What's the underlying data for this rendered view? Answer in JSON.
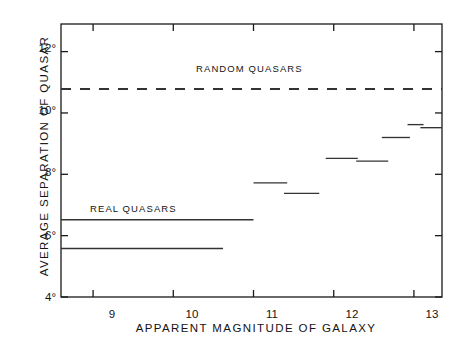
{
  "chart_data": {
    "type": "line",
    "title": "",
    "xlabel": "APPARENT MAGNITUDE OF GALAXY",
    "ylabel": "AVERAGE SEPARATION OF QUASAR",
    "xlim": [
      8.6,
      13.35
    ],
    "ylim": [
      4,
      12.9
    ],
    "xticks": [
      9,
      10,
      11,
      12,
      13
    ],
    "xtick_labels": [
      "9",
      "10",
      "11",
      "12",
      "13"
    ],
    "yticks": [
      4,
      6,
      8,
      10,
      12
    ],
    "ytick_labels": [
      "4°",
      "6°",
      "8°",
      "10°",
      "12°"
    ],
    "grid": false,
    "legend_position": "inline-annotations",
    "annotations": [
      {
        "text": "RANDOM QUASARS",
        "x": 10.55,
        "y": 11.25
      },
      {
        "text": "REAL QUASARS",
        "x": 9.25,
        "y": 7.0
      }
    ],
    "series": [
      {
        "name": "RANDOM QUASARS",
        "style": "dashed",
        "segments": [
          {
            "x0": 8.6,
            "x1": 13.35,
            "y": 10.78
          }
        ]
      },
      {
        "name": "REAL QUASARS (cumulative)",
        "style": "solid",
        "segments": [
          {
            "x0": 8.6,
            "x1": 11.0,
            "y": 6.52
          }
        ]
      },
      {
        "name": "REAL QUASARS (differential)",
        "style": "solid",
        "segments": [
          {
            "x0": 8.6,
            "x1": 10.62,
            "y": 5.58
          },
          {
            "x0": 11.0,
            "x1": 11.42,
            "y": 7.72
          },
          {
            "x0": 11.38,
            "x1": 11.82,
            "y": 7.38
          },
          {
            "x0": 11.9,
            "x1": 12.3,
            "y": 8.52
          },
          {
            "x0": 12.28,
            "x1": 12.68,
            "y": 8.43
          },
          {
            "x0": 12.6,
            "x1": 12.95,
            "y": 9.2
          },
          {
            "x0": 12.92,
            "x1": 13.12,
            "y": 9.62
          },
          {
            "x0": 13.08,
            "x1": 13.35,
            "y": 9.52
          }
        ]
      }
    ]
  },
  "figure": {
    "axis_color": "#1a1a1a",
    "series_color": "#333333",
    "background": "#ffffff",
    "caption": ""
  }
}
